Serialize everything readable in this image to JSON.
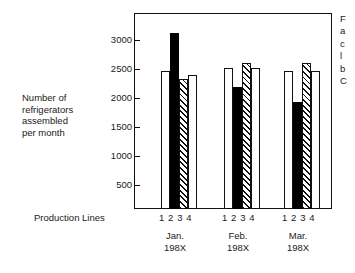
{
  "chart_data": {
    "type": "bar",
    "title": "",
    "subtitle": "",
    "xlabel": "Production Lines",
    "ylabel": "Number of refrigerators assembled per month",
    "ylim": [
      0,
      3200
    ],
    "yticks": [
      500,
      1000,
      1500,
      2000,
      2500,
      3000
    ],
    "ytick_labels": [
      "500",
      "1000",
      "1500",
      "2000",
      "2500",
      "3000"
    ],
    "grid": false,
    "legend": "none",
    "categories": [
      "Jan. 198X",
      "Feb. 198X",
      "Mar. 198X"
    ],
    "group_tick_labels": [
      "1 2 3 4",
      "1 2 3 4",
      "1 2 3 4"
    ],
    "series": [
      {
        "name": "Line 1",
        "style": "open",
        "values": [
          2250,
          2300,
          2250
        ]
      },
      {
        "name": "Line 2",
        "style": "solid",
        "values": [
          2870,
          2000,
          1750
        ]
      },
      {
        "name": "Line 3",
        "style": "hatch",
        "values": [
          2130,
          2380,
          2380
        ]
      },
      {
        "name": "Line 4",
        "style": "open",
        "values": [
          2180,
          2300,
          2250
        ]
      }
    ]
  },
  "axis": {
    "y_title_lines": [
      "Number of",
      "refrigerators",
      "assembled",
      "per month"
    ],
    "x_axis_label": "Production Lines",
    "groups": [
      {
        "tick_numbers": "1 2 3 4",
        "caption_line1": "Jan.",
        "caption_line2": "198X"
      },
      {
        "tick_numbers": "1 2 3 4",
        "caption_line1": "Feb.",
        "caption_line2": "198X"
      },
      {
        "tick_numbers": "1 2 3 4",
        "caption_line1": "Mar.",
        "caption_line2": "198X"
      }
    ],
    "ytick_labels": [
      "3000",
      "2500",
      "2000",
      "1500",
      "1000",
      "500"
    ]
  },
  "side_note": {
    "lines": [
      "F",
      "a",
      "c",
      "l",
      "b",
      "C"
    ]
  },
  "colors": {
    "ink": "#111111",
    "bar_open_fill": "#ffffff",
    "bar_solid_fill": "#000000",
    "background": "#ffffff"
  }
}
